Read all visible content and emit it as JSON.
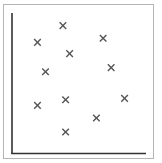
{
  "chart_data": {
    "type": "scatter",
    "title": "",
    "xlabel": "",
    "ylabel": "",
    "xlim": [
      0,
      10
    ],
    "ylim": [
      0,
      10
    ],
    "grid": false,
    "legend": null,
    "marker": "x",
    "marker_color": "#555555",
    "axis_color": "#333333",
    "frame_color": "#b5b5b5",
    "series": [
      {
        "name": "points",
        "points": [
          {
            "x": 3.8,
            "y": 9.1
          },
          {
            "x": 1.9,
            "y": 7.9
          },
          {
            "x": 6.8,
            "y": 8.2
          },
          {
            "x": 4.3,
            "y": 7.1
          },
          {
            "x": 7.4,
            "y": 6.1
          },
          {
            "x": 2.5,
            "y": 5.8
          },
          {
            "x": 4.0,
            "y": 3.8
          },
          {
            "x": 8.4,
            "y": 3.9
          },
          {
            "x": 1.9,
            "y": 3.4
          },
          {
            "x": 6.3,
            "y": 2.5
          },
          {
            "x": 4.0,
            "y": 1.5
          }
        ]
      }
    ]
  }
}
